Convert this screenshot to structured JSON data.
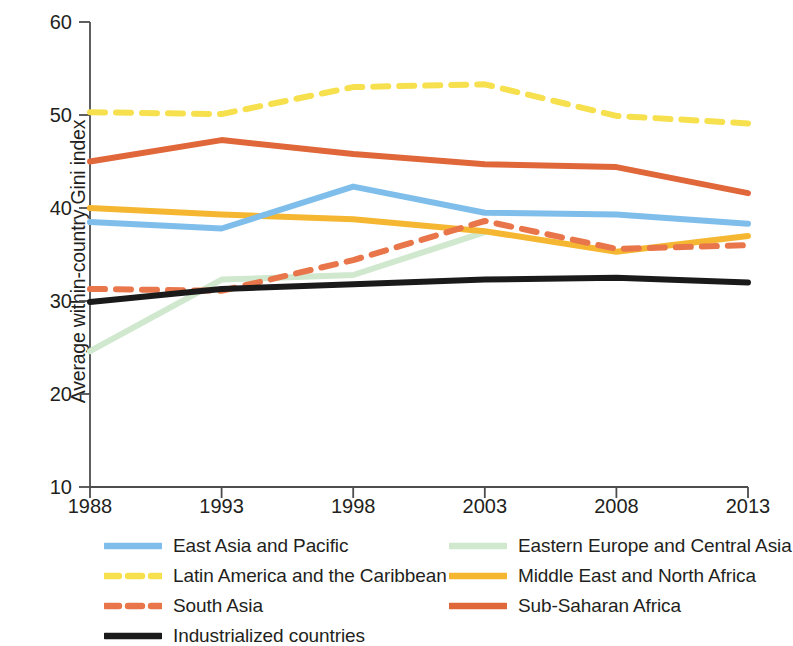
{
  "chart_data": {
    "type": "line",
    "title": "",
    "xlabel": "",
    "ylabel": "Average within-country Gini index",
    "x": [
      1988,
      1993,
      1998,
      2003,
      2008,
      2013
    ],
    "categories": [
      "1988",
      "1993",
      "1998",
      "2003",
      "2008",
      "2013"
    ],
    "xlim": [
      1988,
      2013
    ],
    "ylim": [
      10,
      60
    ],
    "yticks": [
      10,
      20,
      30,
      40,
      50,
      60
    ],
    "xticks": [
      1988,
      1993,
      1998,
      2003,
      2008,
      2013
    ],
    "grid": false,
    "legend_position": "bottom",
    "series": [
      {
        "name": "East Asia and Pacific",
        "color": "#7FBEEA",
        "style": "solid",
        "values": [
          38.5,
          37.8,
          42.3,
          39.5,
          39.3,
          38.3
        ]
      },
      {
        "name": "Eastern Europe and Central Asia",
        "color": "#CFE8CE",
        "style": "solid",
        "values": [
          24.6,
          32.3,
          32.8,
          37.4,
          null,
          null
        ]
      },
      {
        "name": "Latin America and the Caribbean",
        "color": "#F7E04D",
        "style": "dashed",
        "values": [
          50.3,
          50.1,
          53.0,
          53.3,
          49.9,
          49.1
        ]
      },
      {
        "name": "Middle East and North Africa",
        "color": "#F5B731",
        "style": "solid",
        "values": [
          40.0,
          39.3,
          38.8,
          37.5,
          35.3,
          37.0
        ]
      },
      {
        "name": "South Asia",
        "color": "#E8764A",
        "style": "dashed",
        "values": [
          31.3,
          31.1,
          34.4,
          38.6,
          35.6,
          36.0
        ]
      },
      {
        "name": "Sub-Saharan Africa",
        "color": "#E0673A",
        "style": "solid",
        "values": [
          45.0,
          47.3,
          45.8,
          44.7,
          44.4,
          41.6
        ]
      },
      {
        "name": "Industrialized countries",
        "color": "#1A1A1A",
        "style": "solid",
        "values": [
          29.9,
          31.3,
          31.8,
          32.3,
          32.5,
          32.0
        ]
      }
    ]
  },
  "axis": {
    "y_title": "Average within-country Gini index",
    "y_tick_labels": [
      "60",
      "50",
      "40",
      "30",
      "20",
      "10"
    ],
    "x_tick_labels": [
      "1988",
      "1993",
      "1998",
      "2003",
      "2008",
      "2013"
    ]
  },
  "legend": {
    "items": [
      {
        "label": "East Asia and Pacific",
        "color": "#7FBEEA",
        "style": "solid",
        "col": "left",
        "row": 0
      },
      {
        "label": "Eastern Europe and Central Asia",
        "color": "#CFE8CE",
        "style": "solid",
        "col": "right",
        "row": 0
      },
      {
        "label": "Latin America and the Caribbean",
        "color": "#F7E04D",
        "style": "dashed",
        "col": "left",
        "row": 1
      },
      {
        "label": "Middle East and North Africa",
        "color": "#F5B731",
        "style": "solid",
        "col": "right",
        "row": 1
      },
      {
        "label": "South Asia",
        "color": "#E8764A",
        "style": "dashed",
        "col": "left",
        "row": 2
      },
      {
        "label": "Sub-Saharan Africa",
        "color": "#E0673A",
        "style": "solid",
        "col": "right",
        "row": 2
      },
      {
        "label": "Industrialized countries",
        "color": "#1A1A1A",
        "style": "solid",
        "col": "left",
        "row": 3
      }
    ]
  },
  "colors": {
    "axis": "#4d4d4d",
    "text": "#231f20",
    "background": "#ffffff"
  }
}
